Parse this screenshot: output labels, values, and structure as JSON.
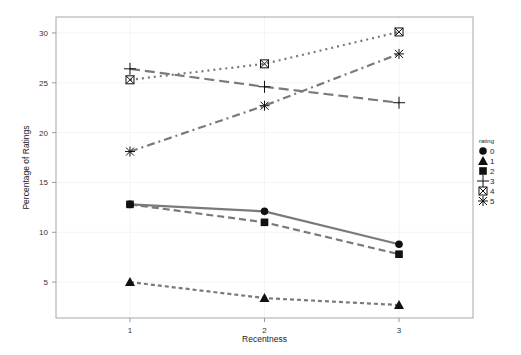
{
  "chart_data": {
    "type": "line",
    "title": "",
    "xlabel": "Recentness",
    "ylabel": "Percentage of Ratings",
    "x": [
      1,
      2,
      3
    ],
    "xticks": [
      "1",
      "2",
      "3"
    ],
    "xlim": [
      0.45,
      3.55
    ],
    "yticks": [
      5,
      10,
      15,
      20,
      25,
      30
    ],
    "ylim": [
      1.4,
      31.6
    ],
    "grid": true,
    "legend": {
      "title": "rating",
      "placement": "right"
    },
    "series": [
      {
        "name": "0",
        "marker": "circle",
        "linestyle": "solid",
        "values": [
          12.8,
          12.1,
          8.8
        ]
      },
      {
        "name": "1",
        "marker": "triangle",
        "linestyle": "dotted-dash",
        "values": [
          5.0,
          3.4,
          2.7
        ]
      },
      {
        "name": "2",
        "marker": "square",
        "linestyle": "dashed",
        "values": [
          12.8,
          11.0,
          7.8
        ]
      },
      {
        "name": "3",
        "marker": "plus",
        "linestyle": "longdash",
        "values": [
          26.4,
          24.6,
          23.0
        ]
      },
      {
        "name": "4",
        "marker": "boxcross",
        "linestyle": "dotted",
        "values": [
          25.3,
          26.9,
          30.1
        ]
      },
      {
        "name": "5",
        "marker": "asterisk",
        "linestyle": "dashdot",
        "values": [
          18.1,
          22.7,
          27.9
        ]
      }
    ],
    "colors": {
      "line": "#7a7a7a",
      "marker": "#111111",
      "axis": "#9a9a9a",
      "grid": "#f4f4f4"
    }
  }
}
